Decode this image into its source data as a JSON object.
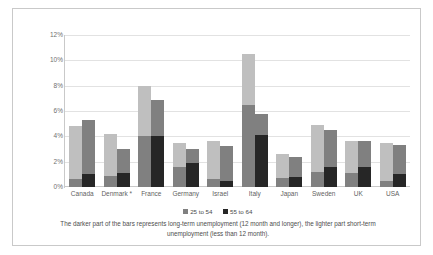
{
  "chart_data": {
    "type": "bar",
    "title": "",
    "subtitle": "",
    "xlabel": "",
    "ylabel": "",
    "ylim": [
      0,
      12
    ],
    "ytick_labels": [
      "0%",
      "2%",
      "4%",
      "6%",
      "8%",
      "10%",
      "12%"
    ],
    "ytick_values": [
      0,
      2,
      4,
      6,
      8,
      10,
      12
    ],
    "grid": true,
    "legend_position": "bottom",
    "stacked": true,
    "categories": [
      "Canada",
      "Denmark *",
      "France",
      "Germany",
      "Israel",
      "Italy",
      "Japan",
      "Sweden",
      "UK",
      "USA"
    ],
    "legend": [
      "25 to 54",
      "55 to 64"
    ],
    "colors": {
      "age25_54_short": "#bfbfbf",
      "age25_54_long": "#808080",
      "age55_64_short": "#808080",
      "age55_64_long": "#262626",
      "gridline": "#e2e2e2",
      "axis": "#c9c9c9",
      "text": "#5f5f5f"
    },
    "series": [
      {
        "name": "25 to 54",
        "stack_parts": [
          "short-term",
          "long-term"
        ],
        "total": [
          4.8,
          4.2,
          8.0,
          3.5,
          3.6,
          10.5,
          2.6,
          4.9,
          3.6,
          3.5
        ],
        "long_term": [
          0.6,
          0.9,
          4.0,
          1.6,
          0.6,
          6.5,
          0.7,
          1.2,
          1.1,
          0.5
        ],
        "short_term": [
          4.2,
          3.3,
          4.0,
          1.9,
          3.0,
          4.0,
          1.9,
          3.7,
          2.5,
          3.0
        ]
      },
      {
        "name": "55 to 64",
        "stack_parts": [
          "short-term",
          "long-term"
        ],
        "total": [
          5.3,
          3.0,
          6.9,
          3.0,
          3.2,
          5.8,
          2.4,
          4.5,
          3.6,
          3.3
        ],
        "long_term": [
          1.0,
          1.1,
          4.0,
          1.9,
          0.5,
          4.1,
          0.8,
          1.6,
          1.6,
          1.0
        ],
        "short_term": [
          4.3,
          1.9,
          2.9,
          1.1,
          2.7,
          1.7,
          1.6,
          2.9,
          2.0,
          2.3
        ]
      }
    ],
    "footnote": "The darker part of the bars represents long-term unemployment (12 month and longer), the lighter part short-term unemployment (less than 12 month)."
  }
}
